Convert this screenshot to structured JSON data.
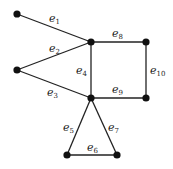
{
  "chart_data": {
    "type": "graph",
    "nodes": [
      {
        "id": "v1",
        "x": 17,
        "y": 14
      },
      {
        "id": "v2",
        "x": 17,
        "y": 70
      },
      {
        "id": "v3",
        "x": 91,
        "y": 42
      },
      {
        "id": "v4",
        "x": 146,
        "y": 42
      },
      {
        "id": "v5",
        "x": 91,
        "y": 98
      },
      {
        "id": "v6",
        "x": 146,
        "y": 98
      },
      {
        "id": "v7",
        "x": 67,
        "y": 155
      },
      {
        "id": "v8",
        "x": 117,
        "y": 155
      }
    ],
    "edges": [
      {
        "label": "e",
        "sub": "1",
        "from": "v1",
        "to": "v3",
        "lx": 49,
        "ly": 22
      },
      {
        "label": "e",
        "sub": "2",
        "from": "v2",
        "to": "v3",
        "lx": 49,
        "ly": 52
      },
      {
        "label": "e",
        "sub": "3",
        "from": "v2",
        "to": "v5",
        "lx": 47,
        "ly": 96
      },
      {
        "label": "e",
        "sub": "4",
        "from": "v3",
        "to": "v5",
        "lx": 76,
        "ly": 74
      },
      {
        "label": "e",
        "sub": "5",
        "from": "v5",
        "to": "v7",
        "lx": 63,
        "ly": 131
      },
      {
        "label": "e",
        "sub": "6",
        "from": "v7",
        "to": "v8",
        "lx": 87,
        "ly": 151
      },
      {
        "label": "e",
        "sub": "7",
        "from": "v5",
        "to": "v8",
        "lx": 108,
        "ly": 131
      },
      {
        "label": "e",
        "sub": "8",
        "from": "v3",
        "to": "v4",
        "lx": 112,
        "ly": 37
      },
      {
        "label": "e",
        "sub": "9",
        "from": "v5",
        "to": "v6",
        "lx": 112,
        "ly": 93
      },
      {
        "label": "e",
        "sub": "10",
        "from": "v4",
        "to": "v6",
        "lx": 150,
        "ly": 74
      }
    ]
  }
}
